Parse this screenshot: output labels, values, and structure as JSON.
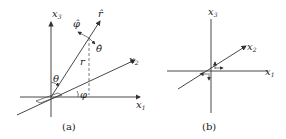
{
  "figure": {
    "panels": [
      {
        "id": "a",
        "caption": "(a)",
        "axes": {
          "x1": "x",
          "x1_sub": "1",
          "x2": "x",
          "x2_sub": "2",
          "x3": "x",
          "x3_sub": "3"
        },
        "labels": {
          "r_hat": "r̂",
          "phi_hat": "φ̂",
          "theta_hat": "θ̂",
          "r": "r",
          "theta": "θ",
          "phi": "φ"
        }
      },
      {
        "id": "b",
        "caption": "(b)",
        "axes": {
          "x1": "x",
          "x1_sub": "1",
          "x2": "x",
          "x2_sub": "2",
          "x3": "x",
          "x3_sub": "3"
        }
      }
    ],
    "colors": {
      "line": "#333333",
      "background": "#ffffff"
    }
  }
}
